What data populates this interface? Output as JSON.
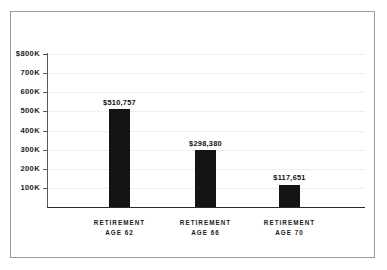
{
  "chart_data": {
    "type": "bar",
    "title": "",
    "subtitle": "",
    "xlabel": "",
    "ylabel": "",
    "categories": [
      "RETIREMENT AGE 62",
      "RETIREMENT AGE 66",
      "RETIREMENT AGE 70"
    ],
    "category_lines": [
      {
        "line1": "RETIREMENT",
        "line2": "AGE 62"
      },
      {
        "line1": "RETIREMENT",
        "line2": "AGE 66"
      },
      {
        "line1": "RETIREMENT",
        "line2": "AGE 70"
      }
    ],
    "values": [
      510757,
      298380,
      117651
    ],
    "value_labels": [
      "$510,757",
      "$298,380",
      "$117,651"
    ],
    "ylim": [
      0,
      800000
    ],
    "yticks": [
      100000,
      200000,
      300000,
      400000,
      500000,
      600000,
      700000,
      800000
    ],
    "ytick_labels": [
      "100K",
      "200K",
      "300K",
      "400K",
      "500K",
      "600K",
      "700K",
      "$800K"
    ],
    "grid": true,
    "grid_axis": "y",
    "legend": false,
    "bar_color": "#141414",
    "grid_color": "#efefef",
    "axis_color": "#2b2b2b",
    "frame_color": "#9a9a9a",
    "background_color": "#ffffff"
  }
}
